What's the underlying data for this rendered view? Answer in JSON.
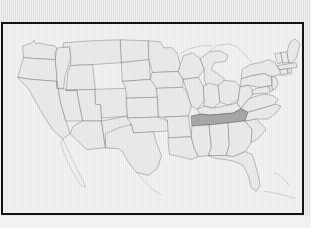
{
  "image": {
    "kind": "map",
    "title": "United States map with one state highlighted",
    "width": 311,
    "height": 228
  },
  "colors": {
    "page_background": "#e2e2e2",
    "bottom_strip": "#f2f2f2",
    "frame_border": "#151515",
    "map_background": "#f3f3f3",
    "state_fill": "#ececec",
    "state_border": "#6e6e6e",
    "highlight_fill": "#a9a9a9",
    "highlight_border": "#4a4a4a",
    "coastline": "#9a9a9a"
  },
  "map": {
    "region": "Contiguous United States",
    "projection_note": "simplified outline, no labels shown",
    "frame": {
      "x": 1,
      "y": 22,
      "width": 303,
      "height": 193,
      "border_width_px": 2
    },
    "highlighted_state": "Tennessee",
    "highlighted_state_count": 1,
    "labels_visible": false,
    "legend_visible": false,
    "title_visible": false,
    "states": [
      "Washington",
      "Oregon",
      "California",
      "Nevada",
      "Idaho",
      "Montana",
      "Wyoming",
      "Utah",
      "Arizona",
      "Colorado",
      "New Mexico",
      "North Dakota",
      "South Dakota",
      "Nebraska",
      "Kansas",
      "Oklahoma",
      "Texas",
      "Minnesota",
      "Iowa",
      "Missouri",
      "Arkansas",
      "Louisiana",
      "Wisconsin",
      "Illinois",
      "Michigan",
      "Indiana",
      "Ohio",
      "Kentucky",
      "Tennessee",
      "Mississippi",
      "Alabama",
      "Georgia",
      "Florida",
      "South Carolina",
      "North Carolina",
      "Virginia",
      "West Virginia",
      "Maryland",
      "Delaware",
      "Pennsylvania",
      "New Jersey",
      "New York",
      "Connecticut",
      "Rhode Island",
      "Massachusetts",
      "Vermont",
      "New Hampshire",
      "Maine"
    ]
  }
}
